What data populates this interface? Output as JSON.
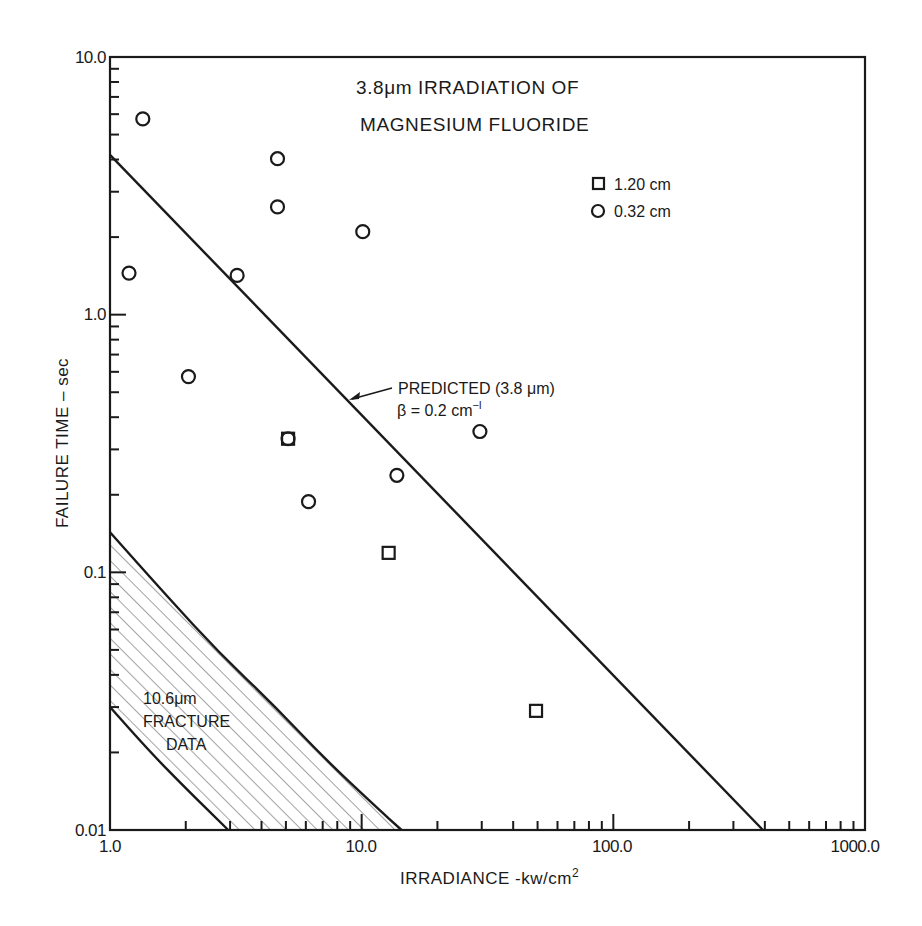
{
  "chart_data": {
    "type": "scatter",
    "title": "3.8μm IRRADIATION OF MAGNESIUM FLUORIDE",
    "title_lines": [
      "3.8μm IRRADIATION OF",
      "MAGNESIUM FLUORIDE"
    ],
    "xlabel": "IRRADIANCE -kw/cm²",
    "ylabel": "FAILURE TIME  –  sec",
    "xscale": "log",
    "yscale": "log",
    "xlim": [
      1.0,
      1000.0
    ],
    "ylim": [
      0.01,
      10.0
    ],
    "x_tick_labels": [
      "1.0",
      "10.0",
      "100.0",
      "1000.0"
    ],
    "y_tick_labels": [
      "10.0",
      "1.0",
      "0.1",
      "0.01"
    ],
    "grid": false,
    "legend": {
      "position": "upper right",
      "entries": [
        {
          "marker": "square",
          "label": "1.20 cm"
        },
        {
          "marker": "circle",
          "label": "0.32 cm"
        }
      ]
    },
    "series": [
      {
        "name": "1.20 cm",
        "marker": "square",
        "points": [
          {
            "x": 5.1,
            "y": 0.33
          },
          {
            "x": 12.8,
            "y": 0.119
          },
          {
            "x": 49.3,
            "y": 0.029
          }
        ]
      },
      {
        "name": "0.32 cm",
        "marker": "circle",
        "points": [
          {
            "x": 1.35,
            "y": 5.75
          },
          {
            "x": 4.63,
            "y": 4.03
          },
          {
            "x": 4.63,
            "y": 2.62
          },
          {
            "x": 10.1,
            "y": 2.1
          },
          {
            "x": 1.19,
            "y": 1.45
          },
          {
            "x": 3.2,
            "y": 1.42
          },
          {
            "x": 2.05,
            "y": 0.575
          },
          {
            "x": 5.1,
            "y": 0.33
          },
          {
            "x": 6.15,
            "y": 0.188
          },
          {
            "x": 13.8,
            "y": 0.238
          },
          {
            "x": 29.5,
            "y": 0.352
          }
        ]
      }
    ],
    "lines": [
      {
        "name": "PREDICTED (3.8 μm)",
        "style": "solid",
        "points": [
          {
            "x": 1.0,
            "y": 4.17
          },
          {
            "x": 393,
            "y": 0.01
          }
        ]
      }
    ],
    "regions": [
      {
        "name": "10.6μm FRACTURE DATA",
        "fill": "hatched",
        "upper_bound": [
          {
            "x": 1.0,
            "y": 0.143
          },
          {
            "x": 1.7,
            "y": 0.08
          },
          {
            "x": 2.7,
            "y": 0.049
          },
          {
            "x": 4.4,
            "y": 0.031
          },
          {
            "x": 7.1,
            "y": 0.019
          },
          {
            "x": 11.2,
            "y": 0.0125
          },
          {
            "x": 14.4,
            "y": 0.01
          }
        ],
        "lower_bound": [
          {
            "x": 1.0,
            "y": 0.03
          },
          {
            "x": 1.45,
            "y": 0.02
          },
          {
            "x": 2.0,
            "y": 0.0145
          },
          {
            "x": 2.95,
            "y": 0.01
          }
        ]
      }
    ],
    "annotations": [
      {
        "text": "PREDICTED (3.8 μm)",
        "arrow_to_line": true
      },
      {
        "text": "β = 0.2 cm⁻¹"
      },
      {
        "text": "10.6μm"
      },
      {
        "text": "FRACTURE"
      },
      {
        "text": "DATA"
      }
    ]
  },
  "labels": {
    "title_line1": "3.8μm IRRADIATION OF",
    "title_line2": "MAGNESIUM FLUORIDE",
    "xlabel_main": "IRRADIANCE -kw/cm",
    "xlabel_sup": "2",
    "ylabel": "FAILURE TIME  –  sec",
    "legend_square": "1.20 cm",
    "legend_circle": "0.32 cm",
    "predicted_label": "PREDICTED (3.8 μm)",
    "beta_main": "β = 0.2 cm",
    "beta_sup": "−l",
    "fracture_line1": "10.6μm",
    "fracture_line2": "FRACTURE",
    "fracture_line3": "DATA",
    "xtick_1": "1.0",
    "xtick_10": "10.0",
    "xtick_100": "100.0",
    "xtick_1000": "1000.0",
    "ytick_10": "10.0",
    "ytick_1": "1.0",
    "ytick_01": "0.1",
    "ytick_001": "0.01"
  },
  "colors": {
    "ink": "#1a1a1a",
    "background": "#ffffff",
    "hatch": "#555555"
  }
}
